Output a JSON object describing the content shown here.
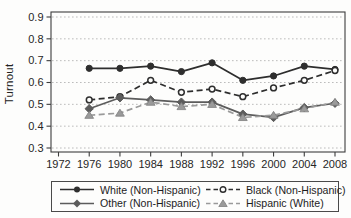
{
  "figure": {
    "ylabel": "Turnout"
  },
  "chart_data": {
    "type": "line",
    "title": "",
    "xlabel": "",
    "ylabel": "Turnout",
    "grid": "horizontal dotted gridlines at each 0.1",
    "legend_position": "bottom boxed, 2 columns x 2 rows",
    "ylim": [
      0.3,
      0.9
    ],
    "y_tick_labels": [
      "0.3",
      "0.4",
      "0.5",
      "0.6",
      "0.7",
      "0.8",
      "0.9"
    ],
    "x_tick_labels": [
      "1972",
      "1976",
      "1980",
      "1984",
      "1988",
      "1992",
      "1996",
      "2000",
      "2004",
      "2008"
    ],
    "x": [
      1976,
      1980,
      1984,
      1988,
      1992,
      1996,
      2000,
      2004,
      2008
    ],
    "series": [
      {
        "name": "White (Non-Hispanic)",
        "values": [
          0.665,
          0.665,
          0.675,
          0.65,
          0.69,
          0.61,
          0.63,
          0.675,
          0.66
        ],
        "color": "#2e2e2e",
        "line": "solid",
        "marker": "circle-filled"
      },
      {
        "name": "Black (Non-Hispanic)",
        "values": [
          0.52,
          0.535,
          0.61,
          0.555,
          0.57,
          0.535,
          0.575,
          0.61,
          0.655
        ],
        "color": "#2e2e2e",
        "line": "dashed",
        "marker": "circle-open"
      },
      {
        "name": "Other (Non-Hispanic)",
        "values": [
          0.48,
          0.53,
          0.52,
          0.51,
          0.51,
          0.455,
          0.44,
          0.485,
          0.505
        ],
        "color": "#5c5c5c",
        "line": "solid",
        "marker": "diamond-filled"
      },
      {
        "name": "Hispanic (White)",
        "values": [
          0.45,
          0.46,
          0.51,
          0.49,
          0.5,
          0.44,
          0.45,
          0.48,
          0.51
        ],
        "color": "#9a9a9a",
        "line": "dashed",
        "marker": "triangle-filled"
      }
    ]
  }
}
